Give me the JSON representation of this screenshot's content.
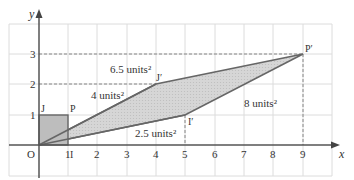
{
  "diagram": {
    "title": "",
    "axes": {
      "x_label": "x",
      "y_label": "y",
      "origin_label": "O",
      "x_ticks": [
        "1",
        "2",
        "3",
        "4",
        "5",
        "6",
        "7",
        "8",
        "9"
      ],
      "y_ticks": [
        "1",
        "2",
        "3"
      ]
    },
    "unit_square": {
      "points": {
        "O": [
          0,
          0
        ],
        "I": [
          1,
          0
        ],
        "P": [
          1,
          1
        ],
        "J": [
          0,
          1
        ]
      },
      "labels": {
        "J": "J",
        "P": "P",
        "I": "I"
      }
    },
    "image_parallelogram": {
      "points": {
        "O": [
          0,
          0
        ],
        "I'": [
          5,
          1
        ],
        "P'": [
          9,
          3
        ],
        "J'": [
          4,
          2
        ]
      },
      "labels": {
        "J_prime": "J′",
        "I_prime": "I′",
        "P_prime": "P′"
      }
    },
    "area_labels": {
      "top_triangle": "6.5 units²",
      "left_triangle": "4 units²",
      "bottom_triangle": "2.5 units²",
      "right_region": "8 units²"
    },
    "colors": {
      "grid": "#d9d9d9",
      "axis": "#555555",
      "shape_fill": "#c8c8c8",
      "shape_stroke": "#666666",
      "dashed": "#777777"
    }
  }
}
